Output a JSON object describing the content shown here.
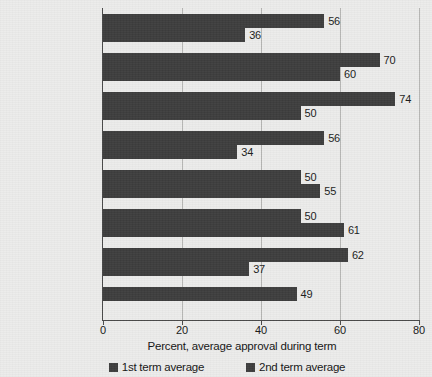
{
  "chart_data": {
    "type": "bar",
    "orientation": "horizontal",
    "title": "",
    "xlabel": "Percent, average approval during term",
    "ylabel": "",
    "xlim": [
      0,
      80
    ],
    "xticks": [
      0,
      20,
      40,
      60,
      80
    ],
    "xtick_labels": [
      "0",
      "20",
      "40",
      "60",
      "80"
    ],
    "grid": true,
    "grid_axis": "x",
    "legend_position": "bottom",
    "categories": [
      "Harry Truman",
      "Dwight Eisenhower",
      "Lyndon Johnson",
      "Richard Nixon",
      "Ronald Reagan",
      "Bill Clinton",
      "George W. Bush",
      "Barack Obama"
    ],
    "series": [
      {
        "name": "1st term average",
        "color": "#3d3d3d",
        "values": [
          56,
          70,
          74,
          56,
          50,
          50,
          62,
          49
        ]
      },
      {
        "name": "2nd term average",
        "color": "#3d3d3d",
        "values": [
          36,
          60,
          50,
          34,
          55,
          61,
          37,
          null
        ]
      }
    ]
  },
  "legend": {
    "items": [
      {
        "label": "1st term average",
        "color": "#3d3d3d"
      },
      {
        "label": "2nd term average",
        "color": "#3d3d3d"
      }
    ]
  },
  "axis": {
    "x_title": "Percent, average approval during term",
    "ticks": [
      "0",
      "20",
      "40",
      "60",
      "80"
    ]
  },
  "rows": [
    {
      "name": "Harry Truman",
      "first": "56",
      "second": "36"
    },
    {
      "name": "Dwight Eisenhower",
      "first": "70",
      "second": "60"
    },
    {
      "name": "Lyndon Johnson",
      "first": "74",
      "second": "50"
    },
    {
      "name": "Richard Nixon",
      "first": "56",
      "second": "34"
    },
    {
      "name": "Ronald Reagan",
      "first": "50",
      "second": "55"
    },
    {
      "name": "Bill Clinton",
      "first": "50",
      "second": "61"
    },
    {
      "name": "George W. Bush",
      "first": "62",
      "second": "37"
    },
    {
      "name": "Barack Obama",
      "first": "49",
      "second": null
    }
  ],
  "colors": {
    "bar": "#3d3d3d",
    "background": "#ececeb",
    "gridline": "#b6b6b4",
    "axis": "#4a4a4a"
  }
}
